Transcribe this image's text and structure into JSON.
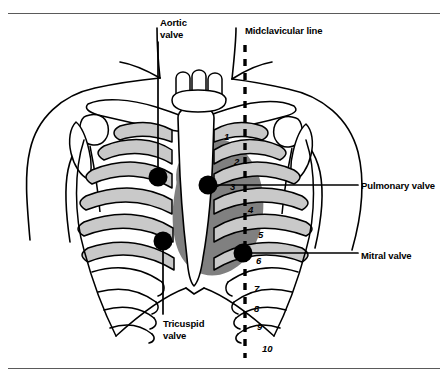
{
  "figure": {
    "kind": "anatomical-diagram",
    "colors": {
      "outline": "#000000",
      "rib_fill": "#c9c9c9",
      "heart_shadow": "#808080",
      "bone_fill": "#ffffff",
      "dot": "#000000",
      "rule": "#5a5a5a",
      "background": "#ffffff"
    }
  },
  "labels": {
    "aortic": "Aortic\nvalve",
    "midclavicular": "Midclavicular line",
    "pulmonary": "Pulmonary valve",
    "mitral": "Mitral valve",
    "tricuspid": "Tricuspid\nvalve"
  },
  "auscultation_points": [
    {
      "name": "aortic",
      "label": "Aortic valve",
      "x": 158,
      "y": 177
    },
    {
      "name": "pulmonary",
      "label": "Pulmonary valve",
      "x": 208,
      "y": 185
    },
    {
      "name": "tricuspid",
      "label": "Tricuspid valve",
      "x": 163,
      "y": 241
    },
    {
      "name": "mitral",
      "label": "Mitral valve",
      "x": 243,
      "y": 253
    }
  ],
  "rib_numbers": [
    "1",
    "2",
    "3",
    "4",
    "5",
    "6",
    "7",
    "8",
    "9",
    "10"
  ],
  "midclavicular_line": {
    "x": 245,
    "y_top": 45,
    "y_bottom": 358,
    "style": "dashed"
  }
}
